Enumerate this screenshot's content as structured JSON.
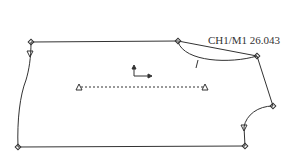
{
  "diagram": {
    "type": "garment-pattern-piece",
    "label": "CH1/M1 26.043",
    "colors": {
      "line": "#333333",
      "background": "#ffffff"
    },
    "points": {
      "top_left": [
        31,
        42
      ],
      "top_right_dart": [
        178,
        41
      ],
      "dart_tip": [
        257,
        56
      ],
      "right_shoulder": [
        273,
        106
      ],
      "armhole_notch": [
        244,
        127
      ],
      "bottom_right": [
        245,
        146
      ],
      "bottom_left": [
        18,
        147
      ]
    },
    "grainline": {
      "start": [
        79,
        87
      ],
      "end": [
        205,
        87
      ]
    },
    "direction_arrow": {
      "origin": [
        134,
        75
      ]
    }
  }
}
